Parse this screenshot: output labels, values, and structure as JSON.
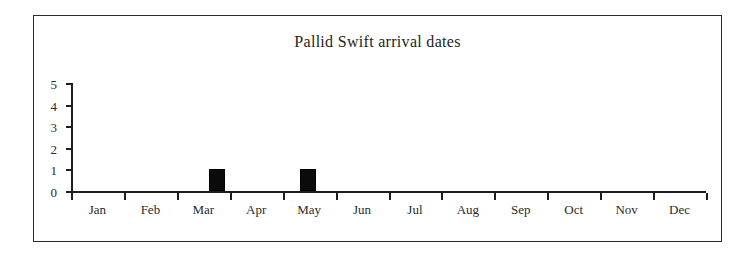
{
  "chart_data": {
    "type": "bar",
    "title": "Pallid Swift arrival dates",
    "xlabel": "",
    "ylabel": "",
    "grid": false,
    "legend": null,
    "ylim": [
      0,
      5
    ],
    "yticks": [
      "5",
      "4",
      "3",
      "2",
      "1",
      "0"
    ],
    "categories": [
      "Jan",
      "Feb",
      "Mar",
      "Apr",
      "May",
      "Jun",
      "Jul",
      "Aug",
      "Sep",
      "Oct",
      "Nov",
      "Dec"
    ],
    "values": [
      0,
      0,
      1,
      0,
      1,
      0,
      0,
      0,
      0,
      0,
      0,
      0
    ],
    "bars": [
      {
        "label": "Mar",
        "value": 1,
        "position_in_month": 0.76
      },
      {
        "label": "May",
        "value": 1,
        "position_in_month": 0.48
      }
    ]
  },
  "colors": {
    "bar": "#0b0b0b",
    "axis": "#1d1d1d",
    "frame": "#2b2b2b",
    "text": "#2a2a2a",
    "background": "#ffffff"
  }
}
